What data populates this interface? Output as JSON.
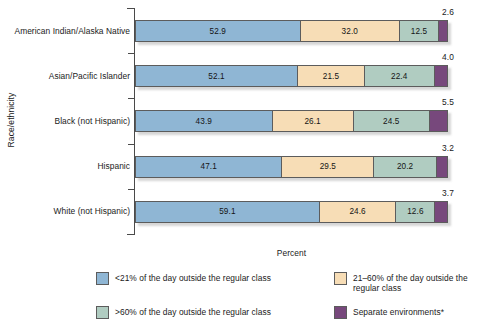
{
  "chart_data": {
    "type": "bar",
    "orientation": "horizontal",
    "stacked": true,
    "title": "",
    "xlabel": "Percent",
    "ylabel": "Race/ethnicity",
    "xlim": [
      0,
      100
    ],
    "grid": false,
    "legend_position": "bottom",
    "categories": [
      "American Indian/Alaska Native",
      "Asian/Pacific Islander",
      "Black (not Hispanic)",
      "Hispanic",
      "White (not Hispanic)"
    ],
    "series": [
      {
        "name": "<21% of the day outside the regular class",
        "color": "#8fb6d4",
        "values": [
          52.9,
          52.1,
          43.9,
          47.1,
          59.1
        ]
      },
      {
        "name": "21–60% of the day outside the regular class",
        "color": "#f7ddb6",
        "values": [
          32.0,
          21.5,
          26.1,
          29.5,
          24.6
        ]
      },
      {
        "name": ">60% of the day outside the regular class",
        "color": "#b0ccc1",
        "values": [
          12.5,
          22.4,
          24.5,
          20.2,
          12.6
        ]
      },
      {
        "name": "Separate environments*",
        "color": "#77487c",
        "values": [
          2.6,
          4.0,
          5.5,
          3.2,
          3.7
        ]
      }
    ]
  },
  "axes": {
    "y_title": "Race/ethnicity",
    "x_title": "Percent"
  },
  "rows": [
    {
      "label": "American Indian/Alaska Native",
      "segments": [
        {
          "value": "52.9",
          "pct": 52.9
        },
        {
          "value": "32.0",
          "pct": 32.0
        },
        {
          "value": "12.5",
          "pct": 12.5
        },
        {
          "value": "2.6",
          "pct": 2.6
        }
      ],
      "outer_value": "2.6"
    },
    {
      "label": "Asian/Pacific Islander",
      "segments": [
        {
          "value": "52.1",
          "pct": 52.1
        },
        {
          "value": "21.5",
          "pct": 21.5
        },
        {
          "value": "22.4",
          "pct": 22.4
        },
        {
          "value": "4.0",
          "pct": 4.0
        }
      ],
      "outer_value": "4.0"
    },
    {
      "label": "Black (not Hispanic)",
      "segments": [
        {
          "value": "43.9",
          "pct": 43.9
        },
        {
          "value": "26.1",
          "pct": 26.1
        },
        {
          "value": "24.5",
          "pct": 24.5
        },
        {
          "value": "5.5",
          "pct": 5.5
        }
      ],
      "outer_value": "5.5"
    },
    {
      "label": "Hispanic",
      "segments": [
        {
          "value": "47.1",
          "pct": 47.1
        },
        {
          "value": "29.5",
          "pct": 29.5
        },
        {
          "value": "20.2",
          "pct": 20.2
        },
        {
          "value": "3.2",
          "pct": 3.2
        }
      ],
      "outer_value": "3.2"
    },
    {
      "label": "White (not Hispanic)",
      "segments": [
        {
          "value": "59.1",
          "pct": 59.1
        },
        {
          "value": "24.6",
          "pct": 24.6
        },
        {
          "value": "12.6",
          "pct": 12.6
        },
        {
          "value": "3.7",
          "pct": 3.7
        }
      ],
      "outer_value": "3.7"
    }
  ],
  "legend": {
    "items": [
      {
        "label": "<21% of the day outside the regular class",
        "color": "#8fb6d4",
        "swatch": "s1"
      },
      {
        "label": "21–60% of the day outside the regular class",
        "color": "#f7ddb6",
        "swatch": "s2"
      },
      {
        "label": ">60% of the day outside the regular class",
        "color": "#b0ccc1",
        "swatch": "s3"
      },
      {
        "label": "Separate environments*",
        "color": "#77487c",
        "swatch": "s4"
      }
    ]
  }
}
